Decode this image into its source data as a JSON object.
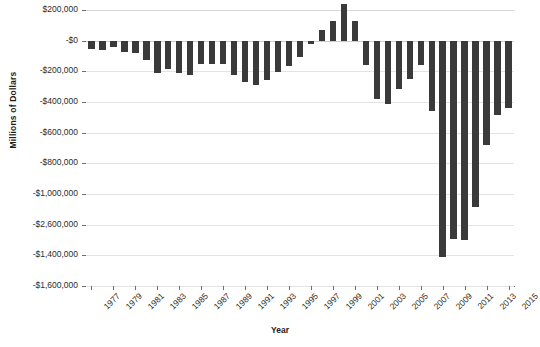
{
  "chart_data": {
    "type": "bar",
    "title": "",
    "xlabel": "Year",
    "ylabel": "Millions of Dollars",
    "grid": true,
    "legend": null,
    "bar_color": "#3a3a3a",
    "ylim": [
      -1600000,
      200000
    ],
    "y_ticks": [
      200000,
      0,
      -200000,
      -400000,
      -600000,
      -800000,
      -1000000,
      -1200000,
      -1400000,
      -1600000
    ],
    "y_tick_labels": [
      "$200,000",
      "-$0",
      "-$200,000",
      "-$400,000",
      "-$600,000",
      "-$800,000",
      "-$1,000,000",
      "-$2,600,000",
      "-$1,400,000",
      "-$1,600,000"
    ],
    "x_tick_labels": [
      "1977",
      "1979",
      "1981",
      "1983",
      "1985",
      "1987",
      "1989",
      "1991",
      "1993",
      "1995",
      "1997",
      "1999",
      "2001",
      "2003",
      "2005",
      "2007",
      "2009",
      "2011",
      "2013",
      "2015"
    ],
    "categories": [
      "1977",
      "1978",
      "1979",
      "1980",
      "1981",
      "1982",
      "1983",
      "1984",
      "1985",
      "1986",
      "1987",
      "1988",
      "1989",
      "1990",
      "1991",
      "1992",
      "1993",
      "1994",
      "1995",
      "1996",
      "1997",
      "1998",
      "1999",
      "2000",
      "2001",
      "2002",
      "2003",
      "2004",
      "2005",
      "2006",
      "2007",
      "2008",
      "2009",
      "2010",
      "2011",
      "2012",
      "2013",
      "2014",
      "2015"
    ],
    "values": [
      -54000,
      -59000,
      -40000,
      -74000,
      -79000,
      -128000,
      -208000,
      -185000,
      -212000,
      -221000,
      -150000,
      -155000,
      -153000,
      -221000,
      -269000,
      -290000,
      -255000,
      -203000,
      -164000,
      -107000,
      -22000,
      69000,
      126000,
      236000,
      128000,
      -158000,
      -378000,
      -413000,
      -318000,
      -248000,
      -161000,
      -459000,
      -1413000,
      -1294000,
      -1300000,
      -1087000,
      -680000,
      -485000,
      -438000
    ]
  }
}
